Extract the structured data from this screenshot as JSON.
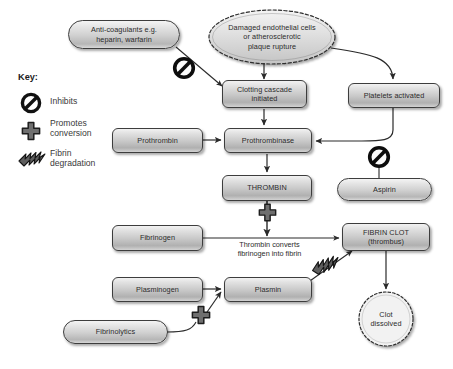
{
  "diagram": {
    "key": {
      "heading": "Key:",
      "entries": [
        {
          "icon": "inhibits-icon",
          "label": "Inhibits"
        },
        {
          "icon": "promotes-conversion-icon",
          "label": "Promotes\nconversion"
        },
        {
          "icon": "fibrin-degradation-icon",
          "label": "Fibrin\ndegradation"
        }
      ]
    },
    "nodes": [
      {
        "id": "anticoagulants",
        "shape": "pill",
        "text": "Anti-coagulants e.g.\nheparin, warfarin"
      },
      {
        "id": "damaged-endothelium",
        "shape": "cloud",
        "text": "Damaged endothelial cells\nor atherosclerotic\nplaque rupture"
      },
      {
        "id": "clotting-cascade",
        "shape": "box",
        "text": "Clotting cascade\ninitiated"
      },
      {
        "id": "platelets-activated",
        "shape": "box",
        "text": "Platelets activated"
      },
      {
        "id": "prothrombin",
        "shape": "box",
        "text": "Prothrombin"
      },
      {
        "id": "prothrombinase",
        "shape": "box",
        "text": "Prothrombinase"
      },
      {
        "id": "thrombin",
        "shape": "box",
        "text": "THROMBIN"
      },
      {
        "id": "aspirin",
        "shape": "pill",
        "text": "Aspirin"
      },
      {
        "id": "fibrinogen",
        "shape": "box",
        "text": "Fibrinogen"
      },
      {
        "id": "fibrin-clot",
        "shape": "box",
        "text": "FIBRIN CLOT\n(thrombus)"
      },
      {
        "id": "plasminogen",
        "shape": "box",
        "text": "Plasminogen"
      },
      {
        "id": "plasmin",
        "shape": "box",
        "text": "Plasmin"
      },
      {
        "id": "fibrinolytics",
        "shape": "pill",
        "text": "Fibrinolytics"
      },
      {
        "id": "clot-dissolved",
        "shape": "circle",
        "text": "Clot\ndissolved"
      }
    ],
    "annotations": [
      {
        "id": "thrombin-converts",
        "text": "Thrombin converts\nfibrinogen into fibrin"
      }
    ],
    "symbols": [
      {
        "id": "inhibit-anticoagulants",
        "type": "inhibits-icon"
      },
      {
        "id": "inhibit-aspirin",
        "type": "inhibits-icon"
      },
      {
        "id": "promote-thrombin",
        "type": "promotes-conversion-icon"
      },
      {
        "id": "promote-fibrinolytics",
        "type": "promotes-conversion-icon"
      },
      {
        "id": "degrade-fibrin",
        "type": "fibrin-degradation-icon"
      }
    ],
    "labels": {
      "anticoagulants": "Anti-coagulants e.g.\nheparin, warfarin",
      "anticoagulants_line1": "Anti-coagulants e.g.",
      "anticoagulants_line2": "heparin, warfarin",
      "damaged_line1": "Damaged endothelial cells",
      "damaged_line2": "or atherosclerotic",
      "damaged_line3": "plaque rupture",
      "clotting_line1": "Clotting cascade",
      "clotting_line2": "initiated",
      "platelets": "Platelets activated",
      "prothrombin": "Prothrombin",
      "prothrombinase": "Prothrombinase",
      "thrombin": "THROMBIN",
      "aspirin": "Aspirin",
      "fibrinogen": "Fibrinogen",
      "fibrin_clot_line1": "FIBRIN CLOT",
      "fibrin_clot_line2": "(thrombus)",
      "plasminogen": "Plasminogen",
      "plasmin": "Plasmin",
      "fibrinolytics": "Fibrinolytics",
      "clot_line1": "Clot",
      "clot_line2": "dissolved",
      "note_line1": "Thrombin converts",
      "note_line2": "fibrinogen into fibrin",
      "key_heading": "Key:",
      "key_inhibits": "Inhibits",
      "key_promotes_line1": "Promotes",
      "key_promotes_line2": "conversion",
      "key_fibrin_line1": "Fibrin",
      "key_fibrin_line2": "degradation"
    },
    "colors": {
      "background": "#ffffff",
      "node_border": "#3d3d3d",
      "node_fill_light": "#f2f2f2",
      "node_fill_dark": "#b0b0b0",
      "arrow": "#2a2a2a",
      "text": "#2b2b2b",
      "symbol": "#1a1a1a"
    }
  }
}
